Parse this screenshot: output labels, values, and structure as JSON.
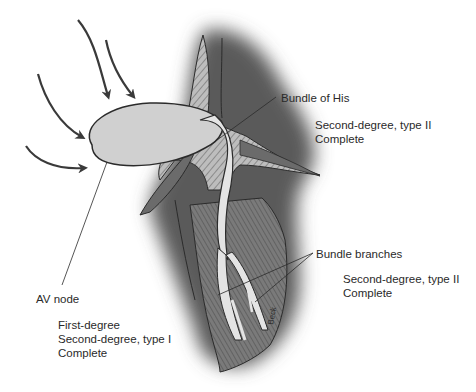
{
  "diagram": {
    "colors": {
      "background": "#ffffff",
      "shadow": "#5f5f5f",
      "tissue": "#8a8a8a",
      "node": "#d0d0d0",
      "outline": "#2b2b2b",
      "text": "#2a2a2a",
      "arrow": "#3a3a3a"
    },
    "labels": {
      "bundle_of_his": "Bundle of His",
      "bundle_of_his_blocks": [
        "Second-degree, type II",
        "Complete"
      ],
      "bundle_branches": "Bundle branches",
      "bundle_branches_blocks": [
        "Second-degree, type II",
        "Complete"
      ],
      "av_node": "AV node",
      "av_node_blocks": [
        "First-degree",
        "Second-degree, type I",
        "Complete"
      ]
    },
    "arrows": {
      "count": 4,
      "meaning": "atrial impulses converging on AV node"
    },
    "signature": "Beck"
  }
}
